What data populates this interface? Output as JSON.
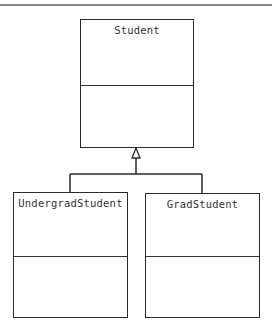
{
  "diagram": {
    "type": "UML class diagram (inheritance)",
    "classes": [
      {
        "name": "Student"
      },
      {
        "name": "UndergradStudent"
      },
      {
        "name": "GradStudent"
      }
    ],
    "relationships": [
      {
        "type": "generalization",
        "from": "UndergradStudent",
        "to": "Student"
      },
      {
        "type": "generalization",
        "from": "GradStudent",
        "to": "Student"
      }
    ]
  }
}
